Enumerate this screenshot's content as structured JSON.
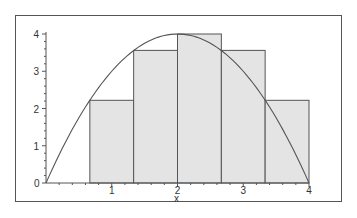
{
  "chart_data": {
    "type": "bar",
    "title": "",
    "xlabel": "x",
    "ylabel": "",
    "xlim": [
      0,
      4
    ],
    "ylim": [
      0,
      4
    ],
    "grid": false,
    "legend": null,
    "x_ticks": [
      "1",
      "2",
      "3",
      "4"
    ],
    "y_ticks": [
      "0",
      "1",
      "2",
      "3",
      "4"
    ],
    "origin_label": "0",
    "bars": [
      {
        "x_start": 0.667,
        "x_end": 1.333,
        "height": 2.22
      },
      {
        "x_start": 1.333,
        "x_end": 2.0,
        "height": 3.56
      },
      {
        "x_start": 2.0,
        "x_end": 2.667,
        "height": 4.0
      },
      {
        "x_start": 2.667,
        "x_end": 3.333,
        "height": 3.56
      },
      {
        "x_start": 3.333,
        "x_end": 4.0,
        "height": 2.22
      }
    ],
    "series": [
      {
        "name": "f(x) = 4x - x^2",
        "type": "line",
        "x": [
          0,
          0.5,
          1,
          1.5,
          2,
          2.5,
          3,
          3.5,
          4
        ],
        "y": [
          0,
          1.75,
          3,
          3.75,
          4,
          3.75,
          3,
          1.75,
          0
        ]
      }
    ],
    "colors": {
      "bar_fill": "#e4e4e4",
      "bar_edge": "#555555",
      "curve": "#555555",
      "axis": "#555555"
    }
  }
}
